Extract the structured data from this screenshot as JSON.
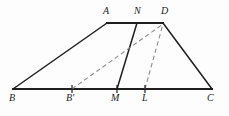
{
  "figure": {
    "name": "trapezoid-area-equivalence-figure",
    "background_color": "#fdfdfd",
    "stroke_color": "#1f1f1f",
    "dash_color": "#8e8e8e",
    "canvas": {
      "width": 229,
      "height": 116
    }
  },
  "points": {
    "B": {
      "label": "B",
      "x": 13,
      "y": 89
    },
    "Bp": {
      "label": "B'",
      "x": 72,
      "y": 89
    },
    "M": {
      "label": "M",
      "x": 117,
      "y": 89
    },
    "L": {
      "label": "L",
      "x": 145,
      "y": 89
    },
    "C": {
      "label": "C",
      "x": 212,
      "y": 89
    },
    "A": {
      "label": "A",
      "x": 107,
      "y": 23
    },
    "N": {
      "label": "N",
      "x": 137,
      "y": 23
    },
    "D": {
      "label": "D",
      "x": 163,
      "y": 23
    }
  },
  "labels": [
    {
      "name": "vertex-label-A",
      "text": "A",
      "left": 103,
      "top": 6
    },
    {
      "name": "vertex-label-N",
      "text": "N",
      "left": 134,
      "top": 6
    },
    {
      "name": "vertex-label-D",
      "text": "D",
      "left": 161,
      "top": 6
    },
    {
      "name": "vertex-label-B",
      "text": "B",
      "left": 9,
      "top": 93
    },
    {
      "name": "vertex-label-Bp",
      "text": "B'",
      "left": 66,
      "top": 93
    },
    {
      "name": "vertex-label-M",
      "text": "M",
      "left": 111,
      "top": 93
    },
    {
      "name": "vertex-label-L",
      "text": "L",
      "left": 142,
      "top": 93
    },
    {
      "name": "vertex-label-C",
      "text": "C",
      "left": 207,
      "top": 93
    }
  ],
  "segments": [
    {
      "name": "segment-BC-base",
      "from": "B",
      "to": "C",
      "style": "solid",
      "width": 2.1
    },
    {
      "name": "segment-AD-top",
      "from": "A",
      "to": "D",
      "style": "solid",
      "width": 2.1
    },
    {
      "name": "segment-BA-left-leg",
      "from": "B",
      "to": "A",
      "style": "solid",
      "width": 1.5
    },
    {
      "name": "segment-DC-right-leg",
      "from": "D",
      "to": "C",
      "style": "solid",
      "width": 1.5
    },
    {
      "name": "segment-MN",
      "from": "M",
      "to": "N",
      "style": "solid",
      "width": 1.5
    },
    {
      "name": "segment-BprimeD",
      "from": "Bp",
      "to": "D",
      "style": "dashed",
      "width": 1.1
    },
    {
      "name": "segment-LD",
      "from": "L",
      "to": "D",
      "style": "dashed",
      "width": 1.1
    }
  ],
  "tick_marks": [
    {
      "name": "tick-mark-Bprime",
      "x": 72,
      "y": 89,
      "half_height": 4
    },
    {
      "name": "tick-mark-M",
      "x": 117,
      "y": 89,
      "half_height": 4
    },
    {
      "name": "tick-mark-L",
      "x": 145,
      "y": 89,
      "half_height": 4
    }
  ]
}
